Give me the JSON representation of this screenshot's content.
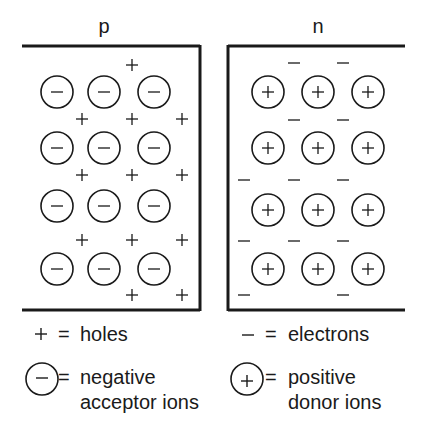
{
  "regions": {
    "p": {
      "label": "p",
      "ion_symbol": "−",
      "ions": [
        {
          "x": 57,
          "y": 92
        },
        {
          "x": 104,
          "y": 92
        },
        {
          "x": 154,
          "y": 92
        },
        {
          "x": 57,
          "y": 148
        },
        {
          "x": 104,
          "y": 148
        },
        {
          "x": 154,
          "y": 148
        },
        {
          "x": 57,
          "y": 206
        },
        {
          "x": 104,
          "y": 206
        },
        {
          "x": 154,
          "y": 206
        },
        {
          "x": 57,
          "y": 269
        },
        {
          "x": 104,
          "y": 269
        },
        {
          "x": 154,
          "y": 269
        }
      ],
      "carrier_symbol": "+",
      "carriers": [
        {
          "x": 132,
          "y": 65
        },
        {
          "x": 82,
          "y": 119
        },
        {
          "x": 132,
          "y": 119
        },
        {
          "x": 182,
          "y": 119
        },
        {
          "x": 82,
          "y": 175
        },
        {
          "x": 132,
          "y": 175
        },
        {
          "x": 182,
          "y": 175
        },
        {
          "x": 82,
          "y": 240
        },
        {
          "x": 132,
          "y": 240
        },
        {
          "x": 182,
          "y": 240
        },
        {
          "x": 132,
          "y": 295
        },
        {
          "x": 182,
          "y": 295
        }
      ]
    },
    "n": {
      "label": "n",
      "ion_symbol": "+",
      "ions": [
        {
          "x": 268,
          "y": 92
        },
        {
          "x": 318,
          "y": 92
        },
        {
          "x": 368,
          "y": 92
        },
        {
          "x": 268,
          "y": 148
        },
        {
          "x": 318,
          "y": 148
        },
        {
          "x": 368,
          "y": 148
        },
        {
          "x": 268,
          "y": 210
        },
        {
          "x": 318,
          "y": 210
        },
        {
          "x": 368,
          "y": 210
        },
        {
          "x": 268,
          "y": 269
        },
        {
          "x": 318,
          "y": 269
        },
        {
          "x": 368,
          "y": 269
        }
      ],
      "carrier_symbol": "−",
      "carriers": [
        {
          "x": 294,
          "y": 63
        },
        {
          "x": 343,
          "y": 63
        },
        {
          "x": 294,
          "y": 120
        },
        {
          "x": 343,
          "y": 120
        },
        {
          "x": 244,
          "y": 180
        },
        {
          "x": 294,
          "y": 180
        },
        {
          "x": 343,
          "y": 180
        },
        {
          "x": 244,
          "y": 241
        },
        {
          "x": 294,
          "y": 241
        },
        {
          "x": 343,
          "y": 241
        },
        {
          "x": 244,
          "y": 295
        },
        {
          "x": 343,
          "y": 295
        }
      ]
    }
  },
  "legend": {
    "holes": {
      "symbol": "+",
      "equals": "=",
      "text": "holes"
    },
    "electrons": {
      "symbol": "−",
      "equals": "=",
      "text": "electrons"
    },
    "acceptor": {
      "symbol": "−",
      "equals": "=",
      "line1": "negative",
      "line2": "acceptor ions"
    },
    "donor": {
      "symbol": "+",
      "equals": "=",
      "line1": "positive",
      "line2": "donor ions"
    }
  },
  "colors": {
    "ink": "#1a1a1a",
    "background": "#ffffff"
  }
}
